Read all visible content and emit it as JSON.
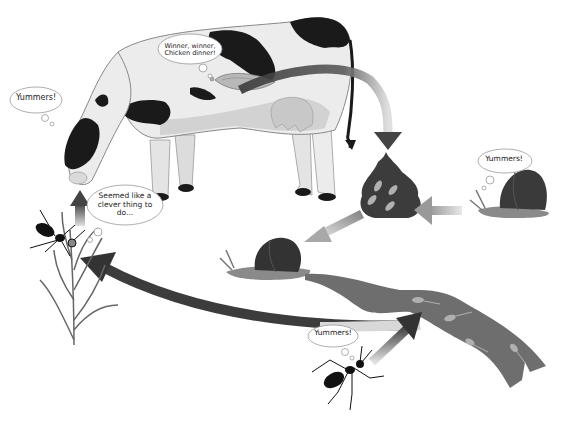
{
  "diagram": {
    "colors": {
      "background": "#ffffff",
      "arrow_dark": "#4a4a4a",
      "arrow_light": "#b5b5b5",
      "cow_body": "#e8e8e8",
      "cow_spots": "#1a1a1a",
      "snail_shell": "#3a3a3a",
      "snail_body": "#8a8a8a",
      "slime_trail": "#6e6e6e",
      "dung": "#3c3c3c",
      "grass": "#6a6a6a",
      "ant": "#111111"
    },
    "nodes": [
      {
        "id": "cow",
        "label": "Cow (definitive host)",
        "icon": "cow-icon"
      },
      {
        "id": "fluke",
        "label": "Adult fluke in liver",
        "icon": "fluke-icon"
      },
      {
        "id": "dung",
        "label": "Dung with eggs",
        "icon": "dung-icon"
      },
      {
        "id": "snail-eating",
        "label": "Snail eating dung",
        "icon": "snail-icon"
      },
      {
        "id": "snail",
        "label": "Infected snail",
        "icon": "snail-icon"
      },
      {
        "id": "slime",
        "label": "Slime ball with cercariae",
        "icon": "slime-trail-icon"
      },
      {
        "id": "ant-eating",
        "label": "Ant eating slime",
        "icon": "ant-icon"
      },
      {
        "id": "ant-grass",
        "label": "Ant clinging to grass",
        "icon": "ant-icon"
      },
      {
        "id": "grass",
        "label": "Grass blade",
        "icon": "grass-icon"
      }
    ],
    "edges": [
      {
        "from": "cow",
        "to": "dung"
      },
      {
        "from": "snail-eating",
        "to": "dung"
      },
      {
        "from": "dung",
        "to": "snail"
      },
      {
        "from": "ant-eating",
        "to": "slime"
      },
      {
        "from": "slime",
        "to": "ant-grass"
      },
      {
        "from": "ant-grass",
        "to": "cow"
      }
    ]
  },
  "bubbles": {
    "fluke": "Winner, winner, Chicken dinner!",
    "cow": "Yummers!",
    "ant_grass": "Seemed like a clever thing to do...",
    "snail": "Yummers!",
    "ant_slime": "Yummers!"
  }
}
